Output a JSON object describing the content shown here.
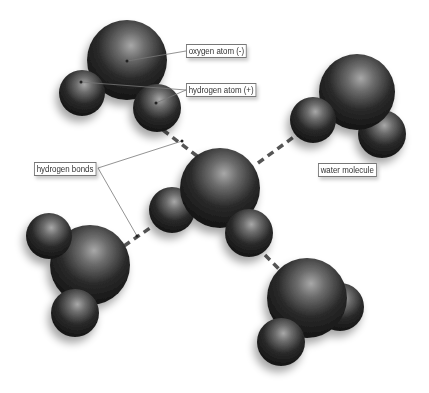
{
  "diagram": {
    "type": "water molecules with hydrogen bonds",
    "labels": {
      "oxygen": "oxygen atom (-)",
      "hydrogen": "hydrogen atom (+)",
      "bonds": "hydrogen bonds",
      "molecule": "water molecule"
    },
    "colors": {
      "atom": "#1a1a1a",
      "highlight": "#9a9a9a",
      "bond": "#555555",
      "leader_line": "#666666"
    },
    "molecules": [
      {
        "id": "top-left",
        "oxygen": [
          127,
          60,
          40
        ],
        "hydrogens": [
          [
            82,
            93,
            23
          ],
          [
            157,
            108,
            24
          ]
        ]
      },
      {
        "id": "top-right",
        "oxygen": [
          357,
          92,
          38
        ],
        "hydrogens": [
          [
            313,
            120,
            23
          ],
          [
            382,
            134,
            24
          ]
        ]
      },
      {
        "id": "center",
        "oxygen": [
          220,
          188,
          40
        ],
        "hydrogens": [
          [
            172,
            210,
            23
          ],
          [
            249,
            233,
            24
          ]
        ]
      },
      {
        "id": "bottom-left",
        "oxygen": [
          90,
          265,
          40
        ],
        "hydrogens": [
          [
            49,
            236,
            23
          ],
          [
            75,
            313,
            24
          ]
        ]
      },
      {
        "id": "bottom-right",
        "oxygen": [
          307,
          298,
          40
        ],
        "hydrogens": [
          [
            340,
            307,
            24
          ],
          [
            281,
            342,
            24
          ]
        ]
      }
    ]
  }
}
